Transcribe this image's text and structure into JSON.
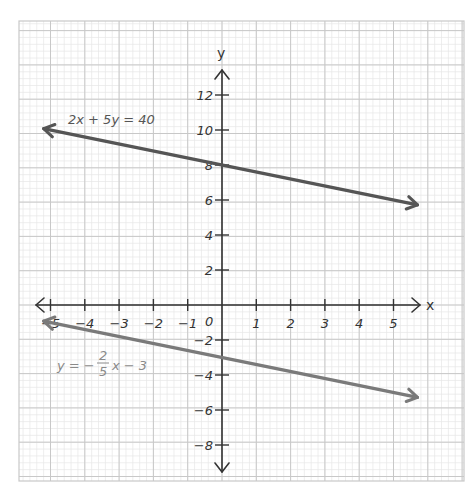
{
  "chart_data": {
    "type": "line",
    "title": "",
    "xlabel": "x",
    "ylabel": "y",
    "xlim": [
      -5.5,
      5.5
    ],
    "ylim": [
      -9,
      13
    ],
    "grid": true,
    "x_ticks": [
      -5,
      -4,
      -3,
      -2,
      -1,
      1,
      2,
      3,
      4,
      5
    ],
    "x_tick_labels": [
      "-5",
      "-4",
      "-3",
      "-2",
      "-1",
      "1",
      "2",
      "3",
      "4",
      "5"
    ],
    "y_ticks": [
      12,
      10,
      8,
      6,
      4,
      2,
      -2,
      -4,
      -6,
      -8
    ],
    "y_tick_labels": [
      "12",
      "10",
      "8",
      "6",
      "4",
      "2",
      "-2",
      "-4",
      "-6",
      "-8"
    ],
    "origin_label": "0",
    "series": [
      {
        "name": "2x + 5y = 40",
        "label": "2x + 5y = 40",
        "color": "#555555",
        "slope": -0.4,
        "intercept": 8,
        "x": [
          -5.5,
          5.5
        ],
        "y": [
          10.2,
          5.8
        ]
      },
      {
        "name": "y = -2/5 x - 3",
        "label_parts": {
          "prefix": "y = −",
          "numerator": "2",
          "denominator": "5",
          "suffix": "x − 3"
        },
        "color": "#7a7a7a",
        "slope": -0.4,
        "intercept": -3,
        "x": [
          -5.5,
          5.5
        ],
        "y": [
          -0.8,
          -5.2
        ]
      }
    ]
  }
}
